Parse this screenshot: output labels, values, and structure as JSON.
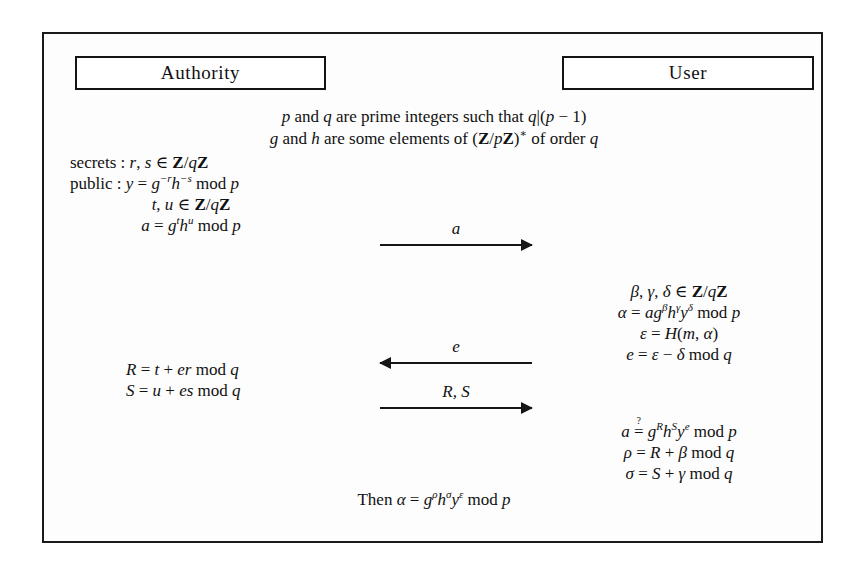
{
  "diagram": {
    "frame_border_color": "#1a1a1a",
    "background_color": "#ffffff"
  },
  "parties": {
    "left": {
      "label": "Authority"
    },
    "right": {
      "label": "User"
    }
  },
  "setup": {
    "line1_plain": "p and q are prime integers such that q|(p − 1)",
    "line2_plain": "g and h are some elements of (Z/pZ)* of order q"
  },
  "authority_params": {
    "line1_plain": "secrets : r, s ∈ Z/qZ",
    "line2_plain": "public : y = g^−r h^−s mod p",
    "line3_plain": "t, u ∈ Z/qZ",
    "line4_plain": "a = g^t h^u mod p",
    "labels": {
      "secrets": "secrets",
      "public": "public"
    }
  },
  "user_blind": {
    "line1_plain": "β, γ, δ ∈ Z/qZ",
    "line2_plain": "α = a g^β h^γ y^δ mod p",
    "line3_plain": "ε = H(m, α)",
    "line4_plain": "e = ε − δ mod q"
  },
  "authority_response": {
    "line1_plain": "R = t + er mod q",
    "line2_plain": "S = u + es mod q"
  },
  "user_verify": {
    "line1_plain": "a ≟ g^R h^S y^e mod p",
    "line2_plain": "ρ = R + β mod q",
    "line3_plain": "σ = S + γ mod q"
  },
  "conclusion": {
    "text_plain": "Then α = g^ρ h^σ y^ε mod p",
    "lead_word": "Then"
  },
  "messages": [
    {
      "id": "a",
      "label": "a",
      "direction": "right",
      "from": "Authority",
      "to": "User"
    },
    {
      "id": "e",
      "label": "e",
      "direction": "left",
      "from": "User",
      "to": "Authority"
    },
    {
      "id": "R,S",
      "label": "R, S",
      "direction": "right",
      "from": "Authority",
      "to": "User"
    }
  ],
  "symbols": {
    "mod": "mod",
    "integers_mod_q": "Z/qZ",
    "group": "(Z/pZ)*",
    "hash": "H"
  }
}
